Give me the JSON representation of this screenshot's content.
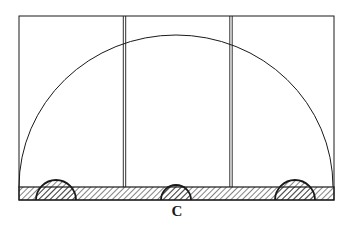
{
  "figure": {
    "label": "C",
    "colors": {
      "ink": "#1a1a1a",
      "background": "#ffffff"
    },
    "frame": {
      "x1": 19,
      "y1": 16,
      "x2": 334,
      "y2": 200
    },
    "dividers_x": [
      124.5,
      231
    ],
    "arch": {
      "cx": 176,
      "cy": 187,
      "rx": 157,
      "ry": 152
    },
    "base_band": {
      "y1": 187,
      "y2": 200
    },
    "small_semicircles": [
      {
        "cx": 56,
        "r": 20
      },
      {
        "cx": 176,
        "r": 15
      },
      {
        "cx": 295,
        "r": 20
      }
    ]
  }
}
